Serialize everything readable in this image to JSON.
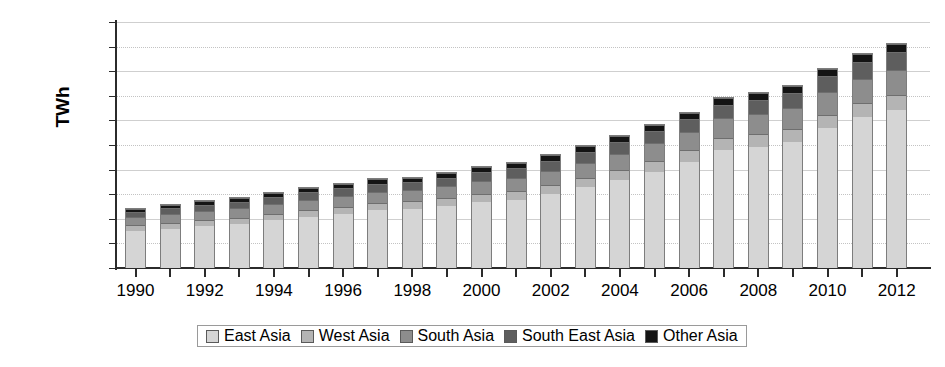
{
  "chart_data": {
    "type": "bar",
    "stacked": true,
    "title": "",
    "xlabel": "",
    "ylabel": "TWh",
    "ylim": [
      0,
      10000
    ],
    "ytick_step": 1000,
    "yticks": [
      0,
      1000,
      2000,
      3000,
      4000,
      5000,
      6000,
      7000,
      8000,
      9000,
      10000
    ],
    "ytick_labels": [
      "0",
      "1000",
      "2000",
      "3000",
      "4000",
      "5000",
      "6000",
      "7000",
      "8000",
      "9000",
      "10000"
    ],
    "grid": true,
    "legend_position": "bottom",
    "categories": [
      "1990",
      "1991",
      "1992",
      "1993",
      "1994",
      "1995",
      "1996",
      "1997",
      "1998",
      "1999",
      "2000",
      "2001",
      "2002",
      "2003",
      "2004",
      "2005",
      "2006",
      "2007",
      "2008",
      "2009",
      "2010",
      "2011",
      "2012"
    ],
    "xtick_labels": [
      "1990",
      "1992",
      "1994",
      "1996",
      "1998",
      "2000",
      "2002",
      "2004",
      "2006",
      "2008",
      "2010",
      "2012"
    ],
    "series": [
      {
        "name": "East Asia",
        "color": "#d5d5d5",
        "values": [
          1530,
          1620,
          1780,
          1950,
          2110,
          2290,
          2450,
          2560,
          2620,
          2830,
          3020,
          3220,
          3520,
          3900,
          4280,
          4700,
          4900,
          5200,
          5400,
          5750,
          6250,
          6700,
          6900
        ]
      },
      {
        "name": "West Asia",
        "color": "#b4b4b4",
        "values": [
          220,
          240,
          260,
          280,
          300,
          320,
          340,
          360,
          380,
          400,
          420,
          450,
          480,
          510,
          540,
          570,
          600,
          640,
          680,
          700,
          730,
          180,
          200
        ]
      },
      {
        "name": "South Asia",
        "color": "#8d8d8d",
        "values": [
          330,
          350,
          380,
          400,
          430,
          460,
          490,
          510,
          530,
          560,
          590,
          630,
          680,
          720,
          760,
          800,
          840,
          880,
          920,
          950,
          990,
          1030,
          1080
        ]
      },
      {
        "name": "South East Asia",
        "color": "#5e5e5e",
        "values": [
          250,
          280,
          310,
          340,
          380,
          420,
          460,
          480,
          440,
          470,
          520,
          580,
          620,
          680,
          740,
          800,
          900,
          1000,
          1050,
          1100,
          1200,
          1300,
          1400
        ]
      },
      {
        "name": "Other Asia",
        "color": "#141414",
        "values": [
          120,
          130,
          140,
          150,
          160,
          170,
          180,
          190,
          200,
          210,
          220,
          230,
          240,
          250,
          260,
          280,
          300,
          320,
          340,
          360,
          380,
          400,
          420
        ]
      }
    ],
    "totals": [
      2450,
      2620,
      2870,
      3120,
      3380,
      3660,
      3920,
      4100,
      4170,
      4470,
      4770,
      5110,
      5540,
      6060,
      6580,
      7150,
      7540,
      8040,
      8390,
      8860,
      9550,
      9610,
      9999
    ],
    "bar_totals_displayed": [
      2450,
      2600,
      2750,
      2880,
      3090,
      3290,
      3450,
      3650,
      3720,
      3900,
      4150,
      4320,
      4620,
      5000,
      5400,
      5850,
      6350,
      6950,
      7150,
      7450,
      8150,
      8750,
      9150
    ]
  },
  "legend": {
    "items": [
      {
        "label": "East Asia",
        "color": "#d5d5d5"
      },
      {
        "label": "West Asia",
        "color": "#b4b4b4"
      },
      {
        "label": "South Asia",
        "color": "#8d8d8d"
      },
      {
        "label": "South East Asia",
        "color": "#5e5e5e"
      },
      {
        "label": "Other Asia",
        "color": "#141414"
      }
    ]
  },
  "axis": {
    "y_title": "TWh"
  },
  "bars": [
    {
      "year": "1990",
      "total": 2450,
      "segments": [
        1530,
        230,
        330,
        240,
        120
      ]
    },
    {
      "year": "1991",
      "total": 2600,
      "segments": [
        1620,
        240,
        350,
        260,
        130
      ]
    },
    {
      "year": "1992",
      "total": 2750,
      "segments": [
        1720,
        250,
        370,
        275,
        135
      ]
    },
    {
      "year": "1993",
      "total": 2880,
      "segments": [
        1820,
        260,
        385,
        275,
        140
      ]
    },
    {
      "year": "1994",
      "total": 3090,
      "segments": [
        1960,
        270,
        405,
        300,
        155
      ]
    },
    {
      "year": "1995",
      "total": 3290,
      "segments": [
        2100,
        280,
        425,
        320,
        165
      ]
    },
    {
      "year": "1996",
      "total": 3450,
      "segments": [
        2230,
        290,
        440,
        320,
        170
      ]
    },
    {
      "year": "1997",
      "total": 3650,
      "segments": [
        2370,
        300,
        460,
        340,
        180
      ]
    },
    {
      "year": "1998",
      "total": 3720,
      "segments": [
        2430,
        310,
        470,
        330,
        180
      ]
    },
    {
      "year": "1999",
      "total": 3900,
      "segments": [
        2540,
        325,
        490,
        350,
        195
      ]
    },
    {
      "year": "2000",
      "total": 4150,
      "segments": [
        2700,
        345,
        520,
        380,
        205
      ]
    },
    {
      "year": "2001",
      "total": 4320,
      "segments": [
        2800,
        360,
        545,
        400,
        215
      ]
    },
    {
      "year": "2002",
      "total": 4620,
      "segments": [
        3020,
        380,
        580,
        420,
        220
      ]
    },
    {
      "year": "2003",
      "total": 5000,
      "segments": [
        3300,
        400,
        620,
        450,
        230
      ]
    },
    {
      "year": "2004",
      "total": 5400,
      "segments": [
        3600,
        425,
        660,
        475,
        240
      ]
    },
    {
      "year": "2005",
      "total": 5850,
      "segments": [
        3950,
        450,
        700,
        500,
        250
      ]
    },
    {
      "year": "2006",
      "total": 6350,
      "segments": [
        4350,
        475,
        740,
        530,
        255
      ]
    },
    {
      "year": "2007",
      "total": 6950,
      "segments": [
        4830,
        500,
        790,
        565,
        265
      ]
    },
    {
      "year": "2008",
      "total": 7150,
      "segments": [
        4950,
        520,
        820,
        590,
        270
      ]
    },
    {
      "year": "2009",
      "total": 7450,
      "segments": [
        5150,
        540,
        860,
        620,
        280
      ]
    },
    {
      "year": "2010",
      "total": 8150,
      "segments": [
        5700,
        570,
        910,
        670,
        300
      ]
    },
    {
      "year": "2011",
      "total": 8750,
      "segments": [
        6150,
        600,
        970,
        710,
        320
      ]
    },
    {
      "year": "2012",
      "total": 9150,
      "segments": [
        6450,
        620,
        1010,
        740,
        330
      ]
    }
  ]
}
